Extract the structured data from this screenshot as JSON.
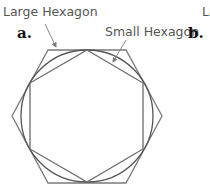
{
  "figure": {
    "panels": [
      {
        "id": "a",
        "label": "a."
      },
      {
        "id": "b",
        "label": "b."
      }
    ],
    "annotations": {
      "large_hexagon": "Large Hexagon",
      "small_hexagon": "Small Hexagon",
      "panel_b_partial": "La"
    },
    "colors": {
      "stroke": "#7a7a7a",
      "circle": "#555555",
      "text": "#555555"
    }
  }
}
